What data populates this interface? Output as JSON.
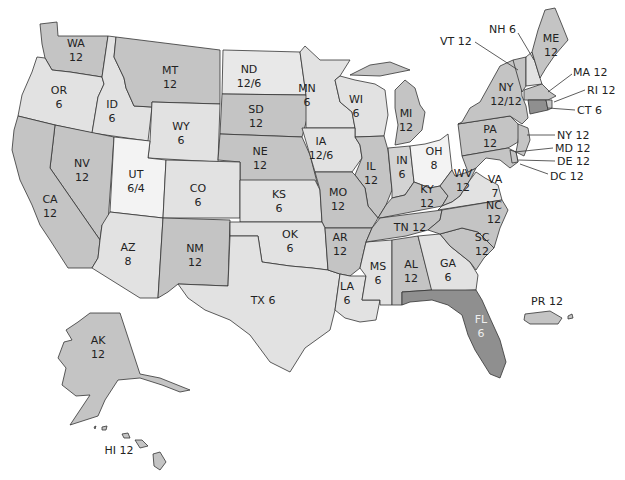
{
  "map": {
    "title": "",
    "shade_colors": {
      "white": "#f3f3f3",
      "light": "#e2e2e2",
      "mid_light": "#d3d3d3",
      "medium": "#c4c4c4",
      "dark": "#8f8f8f"
    },
    "states": {
      "WA": {
        "abbr": "WA",
        "value": "12"
      },
      "OR": {
        "abbr": "OR",
        "value": "6"
      },
      "ID": {
        "abbr": "ID",
        "value": "6"
      },
      "MT": {
        "abbr": "MT",
        "value": "12"
      },
      "WY": {
        "abbr": "WY",
        "value": "6"
      },
      "ND": {
        "abbr": "ND",
        "value": "12/6"
      },
      "SD": {
        "abbr": "SD",
        "value": "12"
      },
      "MN": {
        "abbr": "MN",
        "value": "6"
      },
      "WI": {
        "abbr": "WI",
        "value": "6"
      },
      "MI": {
        "abbr": "MI",
        "value": "12"
      },
      "NE": {
        "abbr": "NE",
        "value": "12"
      },
      "IA": {
        "abbr": "IA",
        "value": "12/6"
      },
      "IL": {
        "abbr": "IL",
        "value": "12"
      },
      "IN": {
        "abbr": "IN",
        "value": "6"
      },
      "OH": {
        "abbr": "OH",
        "value": "8"
      },
      "NV": {
        "abbr": "NV",
        "value": "12"
      },
      "CA": {
        "abbr": "CA",
        "value": "12"
      },
      "UT": {
        "abbr": "UT",
        "value": "6/4"
      },
      "CO": {
        "abbr": "CO",
        "value": "6"
      },
      "KS": {
        "abbr": "KS",
        "value": "6"
      },
      "MO": {
        "abbr": "MO",
        "value": "12"
      },
      "KY": {
        "abbr": "KY",
        "value": "12"
      },
      "WV": {
        "abbr": "WV",
        "value": "12"
      },
      "VA": {
        "abbr": "VA",
        "value": "7"
      },
      "AZ": {
        "abbr": "AZ",
        "value": "8"
      },
      "NM": {
        "abbr": "NM",
        "value": "12"
      },
      "OK": {
        "abbr": "OK",
        "value": "6"
      },
      "AR": {
        "abbr": "AR",
        "value": "12"
      },
      "TN": {
        "abbr": "TN",
        "value": "12"
      },
      "NC": {
        "abbr": "NC",
        "value": "12"
      },
      "SC": {
        "abbr": "SC",
        "value": "12"
      },
      "TX": {
        "abbr": "TX",
        "value": "6"
      },
      "LA": {
        "abbr": "LA",
        "value": "6"
      },
      "MS": {
        "abbr": "MS",
        "value": "6"
      },
      "AL": {
        "abbr": "AL",
        "value": "12"
      },
      "GA": {
        "abbr": "GA",
        "value": "6"
      },
      "FL": {
        "abbr": "FL",
        "value": "6"
      },
      "PA": {
        "abbr": "PA",
        "value": "12"
      },
      "NY": {
        "abbr": "NY",
        "value": "12/12"
      },
      "ME": {
        "abbr": "ME",
        "value": "12"
      },
      "AK": {
        "abbr": "AK",
        "value": "12"
      }
    },
    "callouts": {
      "VT": "VT 12",
      "NH": "NH 6",
      "MA": "MA 12",
      "RI": "RI 12",
      "CT": "CT 6",
      "NJ": "NY 12",
      "MD": "MD 12",
      "DE": "DE 12",
      "DC": "DC 12",
      "TX": "TX 6",
      "TN": "TN 12",
      "PR": "PR 12",
      "HI": "HI 12"
    }
  }
}
